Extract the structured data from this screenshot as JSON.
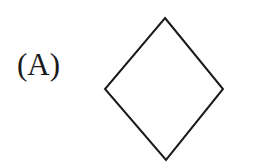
{
  "option": {
    "label": "(A)",
    "shape": {
      "type": "diamond",
      "stroke": "#1a1a1a",
      "fill": "#ffffff",
      "points": [
        [
          165,
          18
        ],
        [
          223,
          89
        ],
        [
          166,
          160
        ],
        [
          105,
          89
        ]
      ]
    }
  }
}
